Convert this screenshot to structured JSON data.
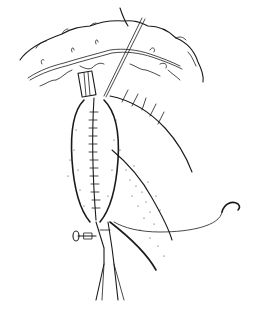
{
  "figure": {
    "kind": "surgical-illustration",
    "style": "black ink line drawing with stippling",
    "background": "#ffffff",
    "ink_color": "#1a1a1a",
    "text_labels": []
  },
  "elements": [
    {
      "name": "omentum-bowel-arc",
      "description": "Curved bowel/colon outline across top with mesenteric vessels"
    },
    {
      "name": "mesenteric-vessels",
      "description": "Branching vessel lines beneath arc"
    },
    {
      "name": "retraction-suture",
      "description": "Thin thread/needle line from upper right down to sutured segment"
    },
    {
      "name": "sutured-segment",
      "description": "Elongated oval tissue pouch with a central running suture line"
    },
    {
      "name": "tissue-flap",
      "description": "Stippled tissue flap to the right of the segment"
    },
    {
      "name": "curved-needle",
      "description": "Curved suture needle with trailing thread at right"
    },
    {
      "name": "clamp-top",
      "description": "Small clamp at top of sutured segment"
    },
    {
      "name": "forceps-bottom",
      "description": "Long forceps/clamp from below with screw lock at left"
    }
  ]
}
